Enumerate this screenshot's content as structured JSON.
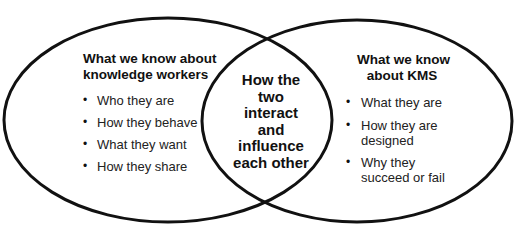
{
  "left": {
    "title_lines": [
      "What we know about",
      "knowledge workers"
    ],
    "items": [
      "Who they are",
      "How they behave",
      "What they want",
      "How they share"
    ]
  },
  "center": {
    "lines": [
      "How the",
      "two",
      "interact",
      "and",
      "influence",
      "each other"
    ]
  },
  "right": {
    "title_lines": [
      "What we know",
      "about KMS"
    ],
    "items": [
      [
        "What they are"
      ],
      [
        "How they are",
        "designed"
      ],
      [
        "Why they",
        "succeed or fail"
      ]
    ]
  },
  "bullet_glyph": "•",
  "colors": {
    "stroke": "#111111",
    "background": "#ffffff"
  }
}
